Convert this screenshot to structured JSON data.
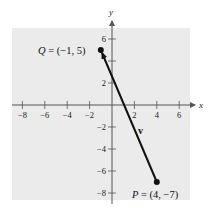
{
  "figure": {
    "background_color": "#ffffff",
    "plot_area_color": "#ebebeb",
    "axis_color": "#555555",
    "vector_color": "#111111"
  },
  "axes": {
    "x_label": "x",
    "y_label": "y",
    "x_ticks": [
      {
        "value": -8,
        "label": "-8"
      },
      {
        "value": -6,
        "label": "-6"
      },
      {
        "value": -4,
        "label": "-4"
      },
      {
        "value": -2,
        "label": "-2"
      },
      {
        "value": 2,
        "label": "2"
      },
      {
        "value": 4,
        "label": "4"
      },
      {
        "value": 6,
        "label": "6"
      }
    ],
    "y_ticks": [
      {
        "value": 6,
        "label": "6"
      },
      {
        "value": 4,
        "label": ""
      },
      {
        "value": 2,
        "label": "2"
      },
      {
        "value": -2,
        "label": "-2"
      },
      {
        "value": -4,
        "label": "-4"
      },
      {
        "value": -6,
        "label": "-6"
      },
      {
        "value": -8,
        "label": "-8"
      }
    ]
  },
  "points": {
    "Q": {
      "name": "Q",
      "x": -1,
      "y": 5,
      "label_coords": "(−1, 5)"
    },
    "P": {
      "name": "P",
      "x": 4,
      "y": -7,
      "label_coords": "(4, −7)"
    }
  },
  "vector": {
    "label": "v",
    "from": "P",
    "to": "Q"
  },
  "chart_data": {
    "type": "scatter",
    "title": "",
    "xlabel": "x",
    "ylabel": "y",
    "xlim": [
      -9,
      7
    ],
    "ylim": [
      -9,
      7
    ],
    "x_ticks": [
      -8,
      -6,
      -4,
      -2,
      2,
      4,
      6
    ],
    "y_ticks": [
      -8,
      -6,
      -4,
      -2,
      2,
      4,
      6
    ],
    "grid": false,
    "series": [
      {
        "name": "Q",
        "x": [
          -1
        ],
        "y": [
          5
        ],
        "annotation": "Q = (−1, 5)"
      },
      {
        "name": "P",
        "x": [
          4
        ],
        "y": [
          -7
        ],
        "annotation": "P = (4, −7)"
      }
    ],
    "annotations": [
      {
        "type": "vector",
        "label": "v",
        "from": [
          4,
          -7
        ],
        "to": [
          -1,
          5
        ]
      }
    ]
  }
}
